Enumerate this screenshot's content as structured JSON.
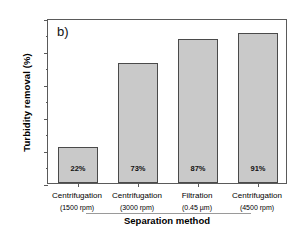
{
  "chart_data": {
    "type": "bar",
    "title": "",
    "panel_label": "b)",
    "categories": [
      "Centrifugation (1500 rpm)",
      "Centrifugation (3000 rpm)",
      "Filtration (0.45 µm)",
      "Centrifugation (4500 rpm)"
    ],
    "category_lines": [
      {
        "line1": "Centrifugation",
        "line2": "(1500 rpm)"
      },
      {
        "line1": "Centrifugation",
        "line2": "(3000 rpm)"
      },
      {
        "line1": "Filtration",
        "line2": "(0.45 µm)"
      },
      {
        "line1": "Centrifugation",
        "line2": "(4500 rpm)"
      }
    ],
    "values": [
      22,
      73,
      87,
      91
    ],
    "data_labels": [
      "22%",
      "73%",
      "87%",
      "91%"
    ],
    "xlabel": "Separation method",
    "ylabel": "Turbidity removal (%)",
    "ylim": [
      0,
      100
    ],
    "yticks": [
      0,
      20,
      40,
      60,
      80,
      100
    ],
    "ytick_labels": [
      "0",
      "20",
      "40",
      "60",
      "80",
      "100"
    ],
    "yminor_ticks": [
      10,
      30,
      50,
      70,
      90
    ],
    "grid": false,
    "legend": false,
    "bar_fill_color": "#c9c9c9",
    "bar_edge_color": "#4a4a4a",
    "axis_color": "#5a5a5a",
    "text_color": "#000000"
  }
}
